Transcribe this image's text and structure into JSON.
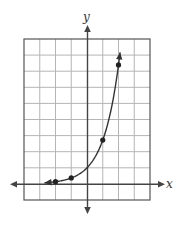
{
  "chart_data": {
    "type": "line",
    "title": "",
    "function": "y = e^x",
    "xlabel": "x",
    "ylabel": "y",
    "xlim": [
      -4,
      4
    ],
    "ylim": [
      -1,
      9
    ],
    "grid": true,
    "grid_step": 1,
    "points": [
      {
        "x": -2,
        "y": 0.14
      },
      {
        "x": -1,
        "y": 0.37
      },
      {
        "x": 1,
        "y": 2.72
      },
      {
        "x": 2,
        "y": 7.39
      }
    ],
    "curve_range": [
      -2.7,
      2.1
    ],
    "y_intercept": 1,
    "arrows": [
      "both-ends-of-curve",
      "both-axes"
    ]
  },
  "labels": {
    "x_axis": "x",
    "y_axis": "y"
  },
  "colors": {
    "grid": "#b5b5b5",
    "border": "#555555",
    "axis": "#444444",
    "curve": "#333333",
    "point": "#222222"
  }
}
